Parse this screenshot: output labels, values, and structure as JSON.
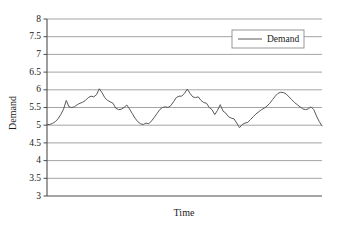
{
  "chart_data": {
    "type": "line",
    "title": "",
    "xlabel": "Time",
    "ylabel": "Demand",
    "ylim": [
      3,
      8
    ],
    "xlim": [
      0,
      100
    ],
    "yticks": [
      3,
      3.5,
      4,
      4.5,
      5,
      5.5,
      6,
      6.5,
      7,
      7.5,
      8
    ],
    "ytick_labels": [
      "3",
      "3.5",
      "4",
      "4.5",
      "5",
      "5.5",
      "6",
      "6.5",
      "7",
      "7.5",
      "8"
    ],
    "xticks": [],
    "xtick_labels": [],
    "grid": "horizontal",
    "legend": {
      "position": "top-right",
      "entries": [
        {
          "name": "Demand",
          "color": "#595959",
          "style": "solid"
        }
      ]
    },
    "series": [
      {
        "name": "Demand",
        "color": "#595959",
        "x": [
          0,
          1,
          2,
          3,
          4,
          5,
          6,
          7,
          8,
          9,
          10,
          11,
          12,
          13,
          14,
          15,
          16,
          17,
          18,
          19,
          20,
          21,
          22,
          23,
          24,
          25,
          26,
          27,
          28,
          29,
          30,
          31,
          32,
          33,
          34,
          35,
          36,
          37,
          38,
          39,
          40,
          41,
          42,
          43,
          44,
          45,
          46,
          47,
          48,
          49,
          50,
          51,
          52,
          53,
          54,
          55,
          56,
          57,
          58,
          59,
          60,
          61,
          62,
          63,
          64,
          65,
          66,
          67,
          68,
          69,
          70,
          71,
          72,
          73,
          74,
          75,
          76,
          77,
          78,
          79,
          80,
          81,
          82,
          83,
          84,
          85,
          86,
          87,
          88,
          89,
          90,
          91,
          92,
          93,
          94,
          95,
          96,
          97,
          98,
          99,
          100
        ],
        "values": [
          5.02,
          5.02,
          5.05,
          5.1,
          5.18,
          5.3,
          5.45,
          5.7,
          5.52,
          5.5,
          5.52,
          5.58,
          5.62,
          5.65,
          5.7,
          5.78,
          5.82,
          5.8,
          5.86,
          6.03,
          5.92,
          5.78,
          5.7,
          5.66,
          5.62,
          5.48,
          5.44,
          5.45,
          5.5,
          5.57,
          5.46,
          5.33,
          5.2,
          5.1,
          5.04,
          5.02,
          5.06,
          5.04,
          5.12,
          5.22,
          5.33,
          5.44,
          5.5,
          5.52,
          5.5,
          5.55,
          5.66,
          5.78,
          5.82,
          5.82,
          5.9,
          6.02,
          5.9,
          5.8,
          5.78,
          5.8,
          5.7,
          5.64,
          5.62,
          5.5,
          5.44,
          5.3,
          5.42,
          5.58,
          5.4,
          5.34,
          5.24,
          5.2,
          5.18,
          5.06,
          4.93,
          5.02,
          5.06,
          5.08,
          5.16,
          5.24,
          5.32,
          5.38,
          5.44,
          5.48,
          5.54,
          5.62,
          5.72,
          5.82,
          5.9,
          5.93,
          5.92,
          5.88,
          5.8,
          5.72,
          5.64,
          5.58,
          5.52,
          5.46,
          5.44,
          5.46,
          5.52,
          5.44,
          5.26,
          5.1,
          4.98
        ]
      }
    ]
  },
  "axes": {
    "y_title": "Demand",
    "x_title": "Time"
  },
  "style": {
    "line_color": "#595959",
    "grid_color": "#9a9a9a",
    "axis_color": "#4d4d4d",
    "text_color": "#1a1a1a",
    "background": "#ffffff"
  }
}
